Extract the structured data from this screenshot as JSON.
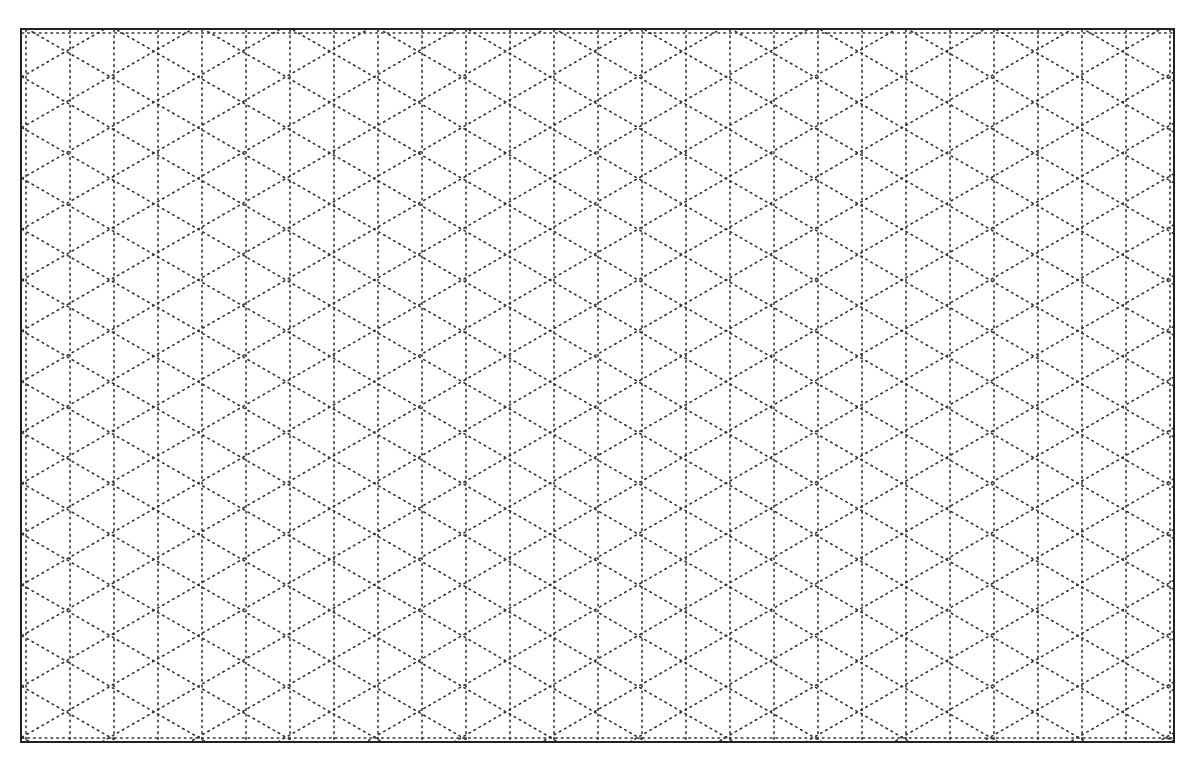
{
  "sheet": {
    "type": "isometric dotted grid paper",
    "border_color": "#222222",
    "dot_color": "#333333",
    "background": "#ffffff",
    "vertical_spacing_px": 44,
    "diagonal_angle_deg": 30,
    "columns": 26,
    "rows": 23
  }
}
